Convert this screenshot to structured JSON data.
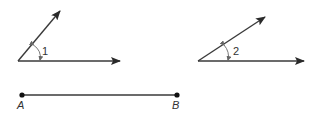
{
  "figure": {
    "angle1": {
      "label": "1",
      "vertex": [
        18,
        61
      ],
      "ray_horizontal_tip": [
        120,
        61
      ],
      "ray_upper_tip": [
        60,
        11
      ],
      "label_pos": [
        40,
        53
      ]
    },
    "angle2": {
      "label": "2",
      "vertex": [
        198,
        61
      ],
      "ray_horizontal_tip": [
        304,
        61
      ],
      "ray_upper_tip": [
        265,
        17
      ],
      "label_pos": [
        232,
        53
      ]
    },
    "segment": {
      "start_label": "A",
      "end_label": "B",
      "start": [
        22,
        95
      ],
      "end": [
        177,
        95
      ]
    },
    "colors": {
      "stroke": "#3a3a3a",
      "arc": "#6a6a6a"
    }
  }
}
